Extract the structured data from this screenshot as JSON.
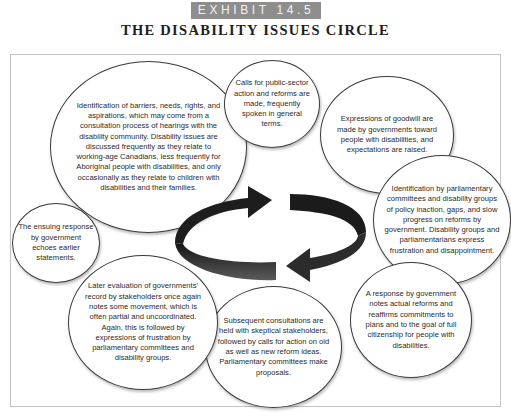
{
  "header": {
    "exhibit_label": "EXHIBIT 14.5",
    "title": "THE DISABILITY ISSUES CIRCLE"
  },
  "diagram": {
    "type": "cycle",
    "center_graphic": "circular-arrows-icon",
    "colors": {
      "arrow": "#222222",
      "bubble_border": "#3a3a3a",
      "badge": "#8e8e8e",
      "frame_border": "#c4c4c4"
    },
    "stages": [
      {
        "id": "identification",
        "text": "Identification of barriers, needs, rights, and aspirations, which may come from a consultation process of hearings with the disability community. Disability issues are discussed frequently as they relate to working-age Canadians, less frequently for Aboriginal people with disabilities, and only occasionally as they relate to children with disabilities and their families."
      },
      {
        "id": "calls-for-action",
        "text": "Calls for public-sector action and reforms are made, frequently spoken in general terms."
      },
      {
        "id": "expressions-of-goodwill",
        "text": "Expressions of goodwill are made by governments toward people with disabilities, and expectations are raised."
      },
      {
        "id": "parliamentary-identification",
        "text": "Identification by parliamentary committees and disability groups of policy inaction, gaps, and slow progress on reforms by government. Disability groups and parliamentarians express frustration and disappointment."
      },
      {
        "id": "government-response",
        "text": "A response by government notes actual reforms and reaffirms commitments to plans and to the goal of full citizenship for people with disabilities."
      },
      {
        "id": "subsequent-consultations",
        "text": "Subsequent consultations are held with skeptical stakeholders, followed by calls for action on old as well as new reform ideas. Parliamentary committees make proposals."
      },
      {
        "id": "later-evaluation",
        "text": "Later evaluation of governments' record by stakeholders once again notes some movement, which is often partial and uncoordinated. Again, this is followed by expressions of frustration by parliamentary committees and disability groups."
      },
      {
        "id": "ensuing-response",
        "text": "The ensuing response by government echoes earlier statements."
      }
    ]
  }
}
